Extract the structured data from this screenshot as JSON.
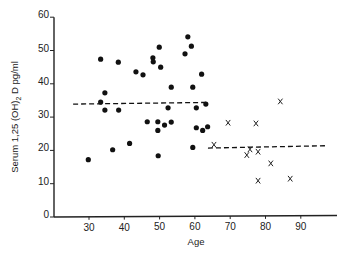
{
  "chart_data": {
    "type": "scatter",
    "title": "",
    "xlabel": "Age",
    "ylabel": "Serum 1,25 (OH)2 D pg/ml",
    "xlim": [
      20,
      98
    ],
    "ylim": [
      0,
      60
    ],
    "xticks": [
      30,
      40,
      50,
      60,
      70,
      80,
      90
    ],
    "yticks": [
      0,
      10,
      20,
      30,
      40,
      50,
      60
    ],
    "grid": false,
    "legend": null,
    "series": [
      {
        "name": "Group 1 (dots)",
        "marker": "dot",
        "points": [
          [
            33.3,
            47.4
          ],
          [
            38.3,
            46.5
          ],
          [
            43.3,
            43.6
          ],
          [
            45.3,
            42.7
          ],
          [
            48.1,
            47.8
          ],
          [
            48.2,
            46.6
          ],
          [
            49.9,
            51.0
          ],
          [
            50.3,
            45.0
          ],
          [
            58.0,
            54.1
          ],
          [
            59.0,
            51.3
          ],
          [
            57.2,
            49.0
          ],
          [
            61.9,
            42.9
          ],
          [
            53.3,
            39.0
          ],
          [
            59.4,
            39.0
          ],
          [
            34.5,
            37.3
          ],
          [
            33.3,
            34.5
          ],
          [
            34.5,
            32.1
          ],
          [
            38.4,
            32.1
          ],
          [
            52.4,
            32.8
          ],
          [
            60.4,
            32.8
          ],
          [
            63.1,
            33.9
          ],
          [
            46.5,
            28.6
          ],
          [
            49.5,
            28.6
          ],
          [
            51.4,
            27.6
          ],
          [
            53.3,
            28.5
          ],
          [
            49.5,
            26.0
          ],
          [
            60.4,
            26.8
          ],
          [
            62.2,
            26.0
          ],
          [
            63.6,
            27.1
          ],
          [
            41.5,
            22.1
          ],
          [
            36.7,
            20.2
          ],
          [
            29.8,
            17.2
          ],
          [
            49.6,
            18.4
          ],
          [
            59.4,
            20.9
          ]
        ]
      },
      {
        "name": "Group 2 (crosses)",
        "marker": "x",
        "points": [
          [
            65.4,
            21.7
          ],
          [
            69.4,
            28.3
          ],
          [
            77.3,
            28.1
          ],
          [
            84.2,
            34.7
          ],
          [
            74.7,
            18.6
          ],
          [
            75.6,
            20.3
          ],
          [
            77.9,
            19.6
          ],
          [
            81.5,
            16.1
          ],
          [
            77.9,
            10.9
          ],
          [
            87.0,
            11.5
          ]
        ]
      }
    ],
    "annotations": [
      {
        "type": "dashed-line",
        "name": "mean-group-1",
        "x": [
          25.5,
          63.4
        ],
        "y": [
          33.9,
          34.4
        ]
      },
      {
        "type": "dashed-line",
        "name": "mean-group-2",
        "x": [
          63.7,
          96.9
        ],
        "y": [
          20.7,
          21.4
        ]
      }
    ]
  },
  "labels": {
    "xlabel": "Age",
    "ylabel_prefix": "Serum 1,25 (OH)",
    "ylabel_sub": "2",
    "ylabel_suffix": " D  pg/ml"
  }
}
